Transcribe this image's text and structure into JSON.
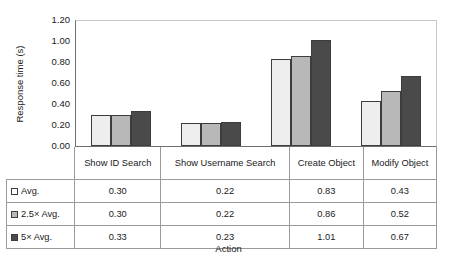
{
  "chart_data": {
    "type": "bar",
    "title": "",
    "xlabel": "Action",
    "ylabel": "Response time (s)",
    "ylim": [
      0.0,
      1.2
    ],
    "ytick_labels": [
      "1.20",
      "1.00",
      "0.80",
      "0.60",
      "0.40",
      "0.20",
      "0.00"
    ],
    "ytick_values": [
      1.2,
      1.0,
      0.8,
      0.6,
      0.4,
      0.2,
      0.0
    ],
    "grid": false,
    "legend_position": "table-left-column",
    "categories": [
      "Show ID Search",
      "Show Username Search",
      "Create Object",
      "Modify Object"
    ],
    "series": [
      {
        "name": "Avg.",
        "color": "#eeeeee",
        "values": [
          0.3,
          0.22,
          0.83,
          0.43
        ]
      },
      {
        "name": "2.5× Avg.",
        "color": "#b8b8b8",
        "values": [
          0.3,
          0.22,
          0.86,
          0.52
        ]
      },
      {
        "name": "5× Avg.",
        "color": "#4a4a4a",
        "values": [
          0.33,
          0.23,
          1.01,
          0.67
        ]
      }
    ],
    "table": {
      "column_headers": [
        "",
        "Show ID Search",
        "Show Username Search",
        "Create Object",
        "Modify Object"
      ],
      "rows": [
        {
          "label": "Avg.",
          "swatch": "#ffffff",
          "cells": [
            "0.30",
            "0.22",
            "0.83",
            "0.43"
          ]
        },
        {
          "label": "2.5× Avg.",
          "swatch": "#b8b8b8",
          "cells": [
            "0.30",
            "0.22",
            "0.86",
            "0.52"
          ]
        },
        {
          "label": "5× Avg.",
          "swatch": "#4a4a4a",
          "cells": [
            "0.33",
            "0.23",
            "1.01",
            "0.67"
          ]
        }
      ]
    }
  },
  "axis": {
    "ylabel": "Response time (s)",
    "xlabel": "Action",
    "ticks": [
      "1.20",
      "1.00",
      "0.80",
      "0.60",
      "0.40",
      "0.20",
      "0.00"
    ]
  },
  "table_header": {
    "c0": "Show ID Search",
    "c1": "Show Username Search",
    "c2": "Create Object",
    "c3": "Modify Object"
  },
  "rows": {
    "r0": {
      "label": "Avg.",
      "v0": "0.30",
      "v1": "0.22",
      "v2": "0.83",
      "v3": "0.43"
    },
    "r1": {
      "label": "2.5× Avg.",
      "v0": "0.30",
      "v1": "0.22",
      "v2": "0.86",
      "v3": "0.52"
    },
    "r2": {
      "label": "5× Avg.",
      "v0": "0.33",
      "v1": "0.23",
      "v2": "1.01",
      "v3": "0.67"
    }
  }
}
